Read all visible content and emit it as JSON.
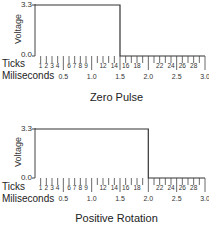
{
  "chart_data": [
    {
      "type": "line",
      "title": "Zero Pulse",
      "xlabel": "Miliseconds",
      "ylabel": "Voltage",
      "secondary_xlabel": "Ticks",
      "y_ticks": [
        "0.0",
        "3.3"
      ],
      "ylim": [
        0.0,
        3.3
      ],
      "xlim": [
        0.0,
        3.0
      ],
      "x_tick_labels_ms": [
        "0.5",
        "1.0",
        "1.5",
        "2.0",
        "2.5",
        "3.0"
      ],
      "tick_labels": [
        "1",
        "2",
        "3",
        "4",
        "6",
        "7",
        "8",
        "9",
        "12",
        "14",
        "16",
        "18",
        "22",
        "24",
        "26",
        "28"
      ],
      "x": [
        0.0,
        1.5,
        1.5,
        3.0
      ],
      "y": [
        3.3,
        3.3,
        0.0,
        0.0
      ],
      "grid": false
    },
    {
      "type": "line",
      "title": "Positive Rotation",
      "xlabel": "Miliseconds",
      "ylabel": "Voltage",
      "secondary_xlabel": "Ticks",
      "y_ticks": [
        "0.0",
        "3.3"
      ],
      "ylim": [
        0.0,
        3.3
      ],
      "xlim": [
        0.0,
        3.0
      ],
      "x_tick_labels_ms": [
        "0.5",
        "1.0",
        "1.5",
        "2.0",
        "2.5",
        "3.0"
      ],
      "tick_labels": [
        "1",
        "2",
        "3",
        "4",
        "6",
        "7",
        "8",
        "9",
        "12",
        "14",
        "16",
        "18",
        "22",
        "24",
        "26",
        "28"
      ],
      "x": [
        0.0,
        2.0,
        2.0,
        3.0
      ],
      "y": [
        3.3,
        3.3,
        0.0,
        0.0
      ],
      "grid": false
    }
  ],
  "charts": [
    {
      "title": "Zero Pulse",
      "ylabel": "Voltage",
      "ytop": "3.3",
      "ybottom": "0.0",
      "ticks_label": "Ticks",
      "ms_label": "Miliseconds"
    },
    {
      "title": "Positive Rotation",
      "ylabel": "Voltage",
      "ytop": "3.3",
      "ybottom": "0.0",
      "ticks_label": "Ticks",
      "ms_label": "Miliseconds"
    }
  ]
}
